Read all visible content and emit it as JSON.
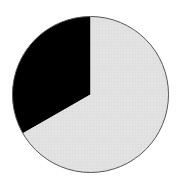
{
  "chart_data": {
    "type": "pie",
    "title": "",
    "categories": [
      "Segment A",
      "Segment B"
    ],
    "values": [
      33.3,
      66.7
    ],
    "colors": [
      "#000000",
      "#e2e2e2"
    ],
    "start_angle_deg": 0,
    "direction": "counterclockwise-from-top for first slice",
    "legend": "none",
    "labels_shown": false,
    "outline_color": "#555555"
  },
  "geometry": {
    "cx": 90.5,
    "cy": 94.5,
    "r": 78
  }
}
